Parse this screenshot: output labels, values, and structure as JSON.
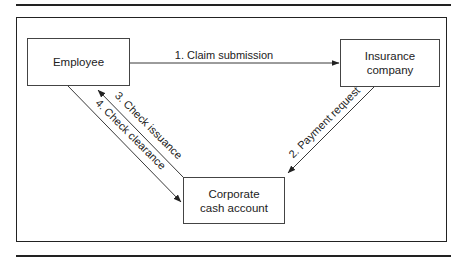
{
  "diagram": {
    "nodes": [
      {
        "id": "employee",
        "label": "Employee"
      },
      {
        "id": "insurance",
        "label": "Insurance company",
        "lines": [
          "Insurance",
          "company"
        ]
      },
      {
        "id": "corporate",
        "label": "Corporate cash account",
        "lines": [
          "Corporate",
          "cash account"
        ]
      }
    ],
    "edges": [
      {
        "id": "e1",
        "from": "employee",
        "to": "insurance",
        "label": "1. Claim submission"
      },
      {
        "id": "e2",
        "from": "insurance",
        "to": "corporate",
        "label": "2. Payment request"
      },
      {
        "id": "e3",
        "from": "corporate",
        "to": "employee",
        "label": "3. Check issuance"
      },
      {
        "id": "e4",
        "from": "employee",
        "to": "corporate",
        "label": "4. Check clearance"
      }
    ],
    "colors": {
      "line": "#222222",
      "box_border": "#444444",
      "background": "#ffffff"
    }
  }
}
